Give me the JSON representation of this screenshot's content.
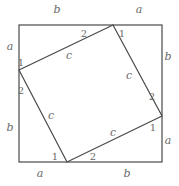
{
  "diagram": {
    "stroke_color": "#4a4a4a",
    "label_color": "#6a6a6a",
    "outer_square": {
      "x1": 19,
      "y1": 25,
      "x2": 162,
      "y2": 162
    },
    "inner_square": {
      "vertices": [
        [
          113,
          25
        ],
        [
          162,
          116
        ],
        [
          67,
          162
        ],
        [
          19,
          70
        ]
      ]
    },
    "side_labels": [
      {
        "text": "b",
        "x": 57,
        "y": 13,
        "side": "top"
      },
      {
        "text": "a",
        "x": 139,
        "y": 13,
        "side": "top"
      },
      {
        "text": "a",
        "x": 10,
        "y": 50,
        "side": "left"
      },
      {
        "text": "b",
        "x": 10,
        "y": 131,
        "side": "left"
      },
      {
        "text": "b",
        "x": 168,
        "y": 60,
        "side": "right"
      },
      {
        "text": "a",
        "x": 168,
        "y": 144,
        "side": "right"
      },
      {
        "text": "a",
        "x": 40,
        "y": 177,
        "side": "bottom"
      },
      {
        "text": "b",
        "x": 127,
        "y": 177,
        "side": "bottom"
      }
    ],
    "hypotenuse_labels": [
      {
        "text": "c",
        "x": 69,
        "y": 59
      },
      {
        "text": "c",
        "x": 129,
        "y": 79
      },
      {
        "text": "c",
        "x": 51,
        "y": 119
      },
      {
        "text": "c",
        "x": 113,
        "y": 136
      }
    ],
    "angle_labels": [
      {
        "text": "2",
        "x": 84,
        "y": 37
      },
      {
        "text": "1",
        "x": 122,
        "y": 37
      },
      {
        "text": "1",
        "x": 21,
        "y": 66
      },
      {
        "text": "2",
        "x": 21,
        "y": 94
      },
      {
        "text": "2",
        "x": 152,
        "y": 100
      },
      {
        "text": "1",
        "x": 153,
        "y": 131
      },
      {
        "text": "1",
        "x": 55,
        "y": 160
      },
      {
        "text": "2",
        "x": 93,
        "y": 160
      }
    ]
  }
}
